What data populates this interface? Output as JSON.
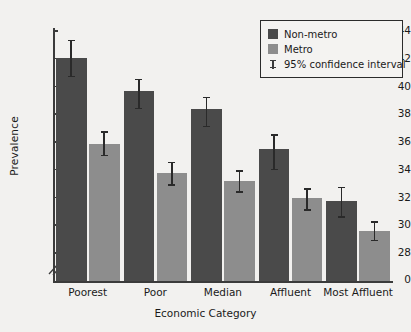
{
  "chart_data": {
    "type": "bar",
    "title": "",
    "xlabel": "Economic Category",
    "ylabel": "Prevalence",
    "categories": [
      "Poorest",
      "Poor",
      "Median",
      "Affluent",
      "Most Affluent"
    ],
    "ylim": [
      28,
      44
    ],
    "yticks": [
      28,
      30,
      32,
      34,
      36,
      38,
      40,
      42,
      44
    ],
    "ytick_labels": [
      "28",
      "30",
      "32",
      "34",
      "36",
      "38",
      "40",
      "42",
      "44"
    ],
    "y_origin_label": "0",
    "axis_break": true,
    "grid": false,
    "legend_position": "top-right",
    "series": [
      {
        "name": "Non-metro",
        "color": "#4a4a4a",
        "values": [
          42.0,
          39.6,
          38.3,
          35.4,
          31.7
        ],
        "ci_low": [
          40.7,
          38.4,
          37.1,
          34.0,
          30.6
        ],
        "ci_high": [
          43.3,
          40.5,
          39.2,
          36.5,
          32.7
        ]
      },
      {
        "name": "Metro",
        "color": "#8d8d8d",
        "values": [
          35.8,
          33.7,
          33.1,
          31.9,
          29.5
        ],
        "ci_low": [
          35.0,
          32.9,
          32.4,
          31.1,
          28.9
        ],
        "ci_high": [
          36.7,
          34.5,
          33.9,
          32.6,
          30.2
        ]
      }
    ],
    "error_bars": {
      "label": "95% confidence interval",
      "level": "95%"
    }
  },
  "legend": {
    "items": [
      {
        "label": "Non-metro",
        "type": "swatch",
        "color": "#4a4a4a"
      },
      {
        "label": "Metro",
        "type": "swatch",
        "color": "#8d8d8d"
      },
      {
        "label": "95% confidence interval",
        "type": "errorbar",
        "color": "#3b3b3b"
      }
    ]
  },
  "colors": {
    "background": "#f2f1ef",
    "axis": "#3b3b3b",
    "text": "#1a1a1a",
    "nonmetro": "#4a4a4a",
    "metro": "#8d8d8d"
  }
}
